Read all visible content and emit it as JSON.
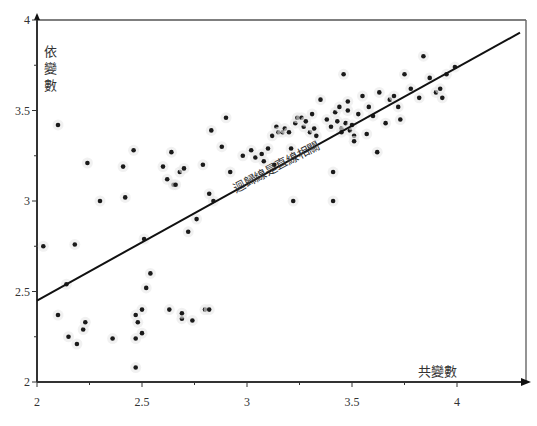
{
  "chart_data": {
    "type": "scatter",
    "title": "",
    "xlabel": "共變數",
    "ylabel": "依變數",
    "annotation": "迴歸線是直線相關",
    "xlim": [
      2,
      4.3
    ],
    "ylim": [
      2,
      4
    ],
    "x_ticks": [
      2,
      2.5,
      3,
      3.5,
      4
    ],
    "x_tick_labels": [
      "2",
      "2.5",
      "3",
      "3.5",
      "4"
    ],
    "y_ticks": [
      2,
      2.5,
      3,
      3.5,
      4
    ],
    "y_tick_labels": [
      "2",
      "2.5",
      "3",
      "3.5",
      "4"
    ],
    "grid": false,
    "legend": null,
    "regression_line": {
      "x": [
        2,
        4.3
      ],
      "y": [
        2.45,
        3.93
      ]
    },
    "colors": {
      "points": "#1a1a1a",
      "line": "#111111",
      "axis": "#333333"
    },
    "points": [
      [
        2.03,
        2.75
      ],
      [
        2.1,
        3.42
      ],
      [
        2.1,
        2.37
      ],
      [
        2.14,
        2.54
      ],
      [
        2.15,
        2.25
      ],
      [
        2.18,
        2.76
      ],
      [
        2.19,
        2.21
      ],
      [
        2.22,
        2.29
      ],
      [
        2.23,
        2.33
      ],
      [
        2.24,
        3.21
      ],
      [
        2.3,
        3.0
      ],
      [
        2.36,
        2.24
      ],
      [
        2.41,
        3.19
      ],
      [
        2.42,
        3.02
      ],
      [
        2.46,
        3.28
      ],
      [
        2.47,
        2.37
      ],
      [
        2.47,
        2.24
      ],
      [
        2.47,
        2.08
      ],
      [
        2.48,
        2.33
      ],
      [
        2.5,
        2.4
      ],
      [
        2.5,
        2.27
      ],
      [
        2.51,
        2.79
      ],
      [
        2.52,
        2.52
      ],
      [
        2.54,
        2.6
      ],
      [
        2.6,
        3.19
      ],
      [
        2.62,
        3.12
      ],
      [
        2.63,
        2.4
      ],
      [
        2.64,
        3.27
      ],
      [
        2.65,
        3.09
      ],
      [
        2.66,
        3.09
      ],
      [
        2.68,
        3.16
      ],
      [
        2.69,
        2.35
      ],
      [
        2.69,
        2.38
      ],
      [
        2.7,
        3.18
      ],
      [
        2.72,
        2.83
      ],
      [
        2.74,
        2.34
      ],
      [
        2.76,
        2.9
      ],
      [
        2.79,
        3.2
      ],
      [
        2.8,
        2.4
      ],
      [
        2.82,
        2.4
      ],
      [
        2.82,
        3.04
      ],
      [
        2.83,
        3.39
      ],
      [
        2.84,
        3.0
      ],
      [
        2.88,
        3.3
      ],
      [
        2.9,
        3.46
      ],
      [
        2.92,
        3.16
      ],
      [
        2.98,
        3.25
      ],
      [
        3.02,
        3.28
      ],
      [
        3.04,
        3.24
      ],
      [
        3.07,
        3.26
      ],
      [
        3.08,
        3.22
      ],
      [
        3.1,
        3.29
      ],
      [
        3.12,
        3.36
      ],
      [
        3.13,
        3.2
      ],
      [
        3.14,
        3.41
      ],
      [
        3.15,
        3.38
      ],
      [
        3.17,
        3.38
      ],
      [
        3.18,
        3.4
      ],
      [
        3.2,
        3.38
      ],
      [
        3.21,
        3.29
      ],
      [
        3.22,
        3.0
      ],
      [
        3.23,
        3.43
      ],
      [
        3.24,
        3.46
      ],
      [
        3.26,
        3.46
      ],
      [
        3.27,
        3.41
      ],
      [
        3.28,
        3.44
      ],
      [
        3.3,
        3.38
      ],
      [
        3.31,
        3.48
      ],
      [
        3.32,
        3.4
      ],
      [
        3.33,
        3.36
      ],
      [
        3.35,
        3.56
      ],
      [
        3.38,
        3.45
      ],
      [
        3.4,
        3.41
      ],
      [
        3.41,
        3.0
      ],
      [
        3.41,
        3.16
      ],
      [
        3.42,
        3.49
      ],
      [
        3.43,
        3.44
      ],
      [
        3.44,
        3.52
      ],
      [
        3.45,
        3.4
      ],
      [
        3.45,
        3.38
      ],
      [
        3.46,
        3.7
      ],
      [
        3.47,
        3.43
      ],
      [
        3.48,
        3.5
      ],
      [
        3.48,
        3.55
      ],
      [
        3.49,
        3.39
      ],
      [
        3.5,
        3.42
      ],
      [
        3.51,
        3.36
      ],
      [
        3.51,
        3.33
      ],
      [
        3.53,
        3.48
      ],
      [
        3.55,
        3.58
      ],
      [
        3.57,
        3.37
      ],
      [
        3.58,
        3.52
      ],
      [
        3.6,
        3.47
      ],
      [
        3.62,
        3.27
      ],
      [
        3.63,
        3.6
      ],
      [
        3.66,
        3.43
      ],
      [
        3.68,
        3.56
      ],
      [
        3.7,
        3.58
      ],
      [
        3.72,
        3.52
      ],
      [
        3.73,
        3.45
      ],
      [
        3.75,
        3.7
      ],
      [
        3.78,
        3.62
      ],
      [
        3.82,
        3.57
      ],
      [
        3.84,
        3.8
      ],
      [
        3.87,
        3.68
      ],
      [
        3.9,
        3.6
      ],
      [
        3.92,
        3.62
      ],
      [
        3.93,
        3.57
      ],
      [
        3.95,
        3.7
      ],
      [
        3.99,
        3.74
      ]
    ]
  }
}
